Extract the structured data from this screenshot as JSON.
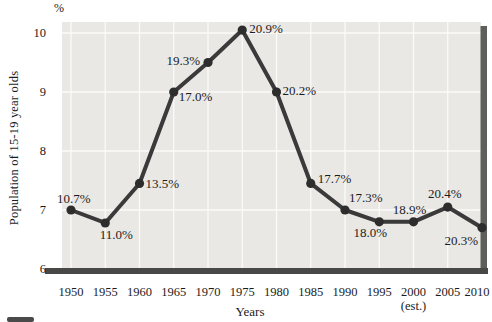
{
  "chart_data": {
    "type": "line",
    "title": "",
    "xlabel": "Years",
    "ylabel": "Population of 15-19 year olds",
    "y_axis_unit": "%",
    "categories": [
      "1950",
      "1955",
      "1960",
      "1965",
      "1970",
      "1975",
      "1980",
      "1985",
      "1990",
      "1995",
      "2000",
      "2005",
      "2010"
    ],
    "x_tick_note": {
      "index": 10,
      "text": "(est.)"
    },
    "y_ticks": [
      6,
      7,
      8,
      9,
      10
    ],
    "ylim": [
      6,
      10.19
    ],
    "grid": true,
    "legend": "none",
    "series": [
      {
        "name": "Population of 15-19 year olds",
        "axis_values": [
          7.0,
          6.78,
          7.45,
          9.0,
          9.5,
          10.05,
          9.0,
          7.45,
          7.0,
          6.8,
          6.8,
          7.05,
          6.7
        ],
        "point_labels": [
          "10.7%",
          "11.0%",
          "13.5%",
          "17.0%",
          "19.3%",
          "20.9%",
          "20.2%",
          "17.7%",
          "17.3%",
          "18.0%",
          "18.9%",
          "20.4%",
          "20.3%"
        ]
      }
    ],
    "point_label_placement": [
      {
        "dx": -14,
        "dy": -7,
        "anchor": "start"
      },
      {
        "dx": 11,
        "dy": 16,
        "anchor": "middle"
      },
      {
        "dx": 6,
        "dy": 5,
        "anchor": "start"
      },
      {
        "dx": 5,
        "dy": 9,
        "anchor": "start"
      },
      {
        "dx": -8,
        "dy": 2,
        "anchor": "end"
      },
      {
        "dx": 7,
        "dy": 3,
        "anchor": "start"
      },
      {
        "dx": 6,
        "dy": 3,
        "anchor": "start"
      },
      {
        "dx": 7,
        "dy": 0,
        "anchor": "start"
      },
      {
        "dx": 4,
        "dy": -8,
        "anchor": "start"
      },
      {
        "dx": -9,
        "dy": 15,
        "anchor": "middle"
      },
      {
        "dx": -4,
        "dy": -8,
        "anchor": "middle"
      },
      {
        "dx": -3,
        "dy": -9,
        "anchor": "middle"
      },
      {
        "dx": -4,
        "dy": 17,
        "anchor": "end"
      }
    ]
  },
  "colors": {
    "background": "#ffffff",
    "panel": "#e9e8e5",
    "gridline": "#fbfbf9",
    "line": "#3a3a3a",
    "marker": "#2d2d2d",
    "axis_bar": "#484846",
    "shadow_bar": "#5e5e5c",
    "text": "#1c1c1c"
  }
}
